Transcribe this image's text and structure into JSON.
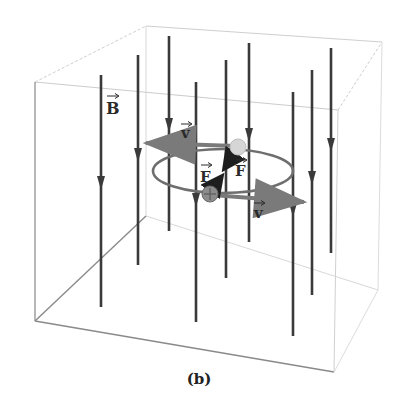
{
  "figure": {
    "caption": "(b)",
    "labels": {
      "field": "B",
      "velocity_top": "v",
      "velocity_bottom": "v",
      "force_left": "F",
      "force_right": "F"
    },
    "colors": {
      "field_line": "#3a3a3a",
      "box_front": "#8a8a8a",
      "box_back": "#c8c8c8",
      "orbit": "#6e6e6e",
      "velocity_arrow": "#7a7a7a",
      "force_arrow": "#1e1e1e",
      "particle_positive": "#8c8c8c",
      "particle_ghost": "#d6d6d6"
    },
    "box": {
      "front": [
        [
          35,
          82
        ],
        [
          338,
          110
        ],
        [
          334,
          372
        ],
        [
          35,
          321
        ]
      ],
      "back": [
        [
          146,
          26
        ],
        [
          382,
          42
        ],
        [
          378,
          290
        ],
        [
          146,
          216
        ]
      ]
    },
    "field_lines": [
      {
        "x": 101,
        "top": 75,
        "bottom": 307,
        "arrow_y": 188
      },
      {
        "x": 138,
        "top": 55,
        "bottom": 265,
        "arrow_y": 160
      },
      {
        "x": 169,
        "top": 36,
        "bottom": 231,
        "arrow_y": 130
      },
      {
        "x": 196,
        "top": 82,
        "bottom": 322,
        "arrow_y": 205
      },
      {
        "x": 226,
        "top": 60,
        "bottom": 278,
        "arrow_y": null
      },
      {
        "x": 249,
        "top": 43,
        "bottom": 242,
        "arrow_y": 140
      },
      {
        "x": 293,
        "top": 92,
        "bottom": 336,
        "arrow_y": 215
      },
      {
        "x": 312,
        "top": 70,
        "bottom": 295,
        "arrow_y": 183
      },
      {
        "x": 331,
        "top": 48,
        "bottom": 253,
        "arrow_y": 150
      }
    ],
    "orbit": {
      "cx": 223,
      "cy": 171,
      "rx": 70,
      "ry": 22
    },
    "particles": [
      {
        "name": "positive-charge",
        "x": 210,
        "y": 194,
        "r": 8,
        "symbol": "+"
      },
      {
        "name": "ghost-charge",
        "x": 238,
        "y": 147,
        "r": 8,
        "symbol": ""
      }
    ]
  }
}
